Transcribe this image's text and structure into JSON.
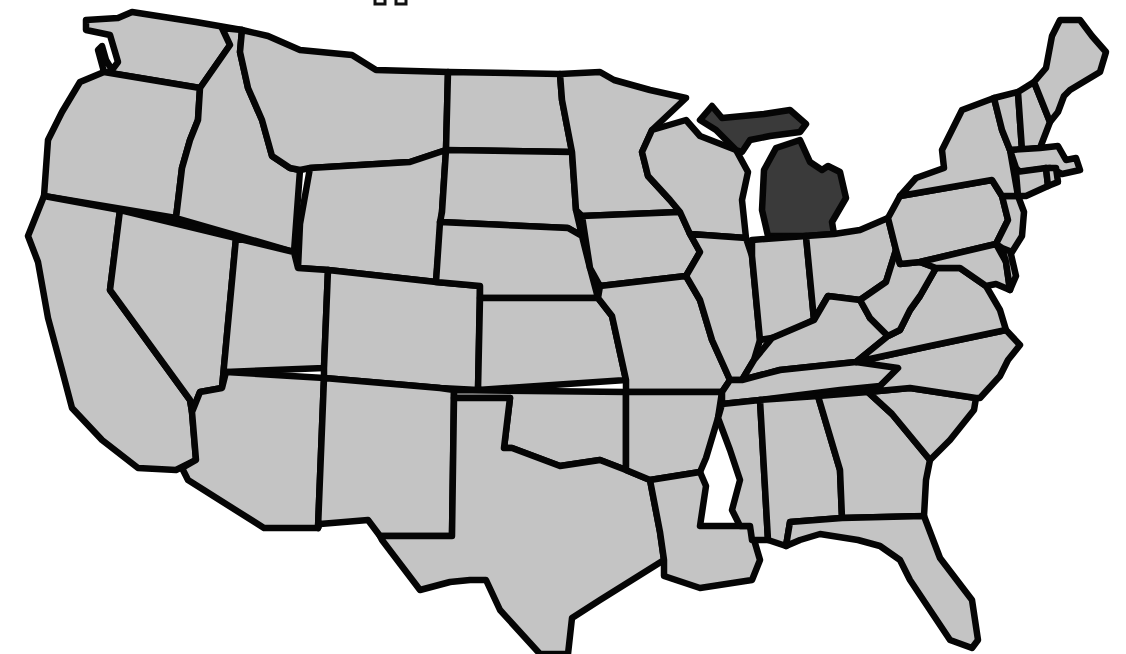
{
  "map": {
    "type": "choropleth-outline",
    "region": "Contiguous United States",
    "colors": {
      "background": "#ffffff",
      "state_fill": "#c4c4c4",
      "highlight_fill": "#3a3a3a",
      "border": "#050505"
    },
    "highlighted_states": [
      "Michigan"
    ],
    "states": [
      {
        "id": "WA",
        "name": "Washington",
        "highlighted": false
      },
      {
        "id": "OR",
        "name": "Oregon",
        "highlighted": false
      },
      {
        "id": "CA",
        "name": "California",
        "highlighted": false
      },
      {
        "id": "ID",
        "name": "Idaho",
        "highlighted": false
      },
      {
        "id": "NV",
        "name": "Nevada",
        "highlighted": false
      },
      {
        "id": "MT",
        "name": "Montana",
        "highlighted": false
      },
      {
        "id": "WY",
        "name": "Wyoming",
        "highlighted": false
      },
      {
        "id": "UT",
        "name": "Utah",
        "highlighted": false
      },
      {
        "id": "AZ",
        "name": "Arizona",
        "highlighted": false
      },
      {
        "id": "CO",
        "name": "Colorado",
        "highlighted": false
      },
      {
        "id": "NM",
        "name": "New Mexico",
        "highlighted": false
      },
      {
        "id": "ND",
        "name": "North Dakota",
        "highlighted": false
      },
      {
        "id": "SD",
        "name": "South Dakota",
        "highlighted": false
      },
      {
        "id": "NE",
        "name": "Nebraska",
        "highlighted": false
      },
      {
        "id": "KS",
        "name": "Kansas",
        "highlighted": false
      },
      {
        "id": "OK",
        "name": "Oklahoma",
        "highlighted": false
      },
      {
        "id": "TX",
        "name": "Texas",
        "highlighted": false
      },
      {
        "id": "MN",
        "name": "Minnesota",
        "highlighted": false
      },
      {
        "id": "IA",
        "name": "Iowa",
        "highlighted": false
      },
      {
        "id": "MO",
        "name": "Missouri",
        "highlighted": false
      },
      {
        "id": "AR",
        "name": "Arkansas",
        "highlighted": false
      },
      {
        "id": "LA",
        "name": "Louisiana",
        "highlighted": false
      },
      {
        "id": "WI",
        "name": "Wisconsin",
        "highlighted": false
      },
      {
        "id": "IL",
        "name": "Illinois",
        "highlighted": false
      },
      {
        "id": "MI",
        "name": "Michigan",
        "highlighted": true
      },
      {
        "id": "IN",
        "name": "Indiana",
        "highlighted": false
      },
      {
        "id": "OH",
        "name": "Ohio",
        "highlighted": false
      },
      {
        "id": "KY",
        "name": "Kentucky",
        "highlighted": false
      },
      {
        "id": "TN",
        "name": "Tennessee",
        "highlighted": false
      },
      {
        "id": "MS",
        "name": "Mississippi",
        "highlighted": false
      },
      {
        "id": "AL",
        "name": "Alabama",
        "highlighted": false
      },
      {
        "id": "GA",
        "name": "Georgia",
        "highlighted": false
      },
      {
        "id": "FL",
        "name": "Florida",
        "highlighted": false
      },
      {
        "id": "SC",
        "name": "South Carolina",
        "highlighted": false
      },
      {
        "id": "NC",
        "name": "North Carolina",
        "highlighted": false
      },
      {
        "id": "VA",
        "name": "Virginia",
        "highlighted": false
      },
      {
        "id": "WV",
        "name": "West Virginia",
        "highlighted": false
      },
      {
        "id": "PA",
        "name": "Pennsylvania",
        "highlighted": false
      },
      {
        "id": "NY",
        "name": "New York",
        "highlighted": false
      },
      {
        "id": "MD",
        "name": "Maryland",
        "highlighted": false
      },
      {
        "id": "DE",
        "name": "Delaware",
        "highlighted": false
      },
      {
        "id": "NJ",
        "name": "New Jersey",
        "highlighted": false
      },
      {
        "id": "CT",
        "name": "Connecticut",
        "highlighted": false
      },
      {
        "id": "RI",
        "name": "Rhode Island",
        "highlighted": false
      },
      {
        "id": "MA",
        "name": "Massachusetts",
        "highlighted": false
      },
      {
        "id": "VT",
        "name": "Vermont",
        "highlighted": false
      },
      {
        "id": "NH",
        "name": "New Hampshire",
        "highlighted": false
      },
      {
        "id": "ME",
        "name": "Maine",
        "highlighted": false
      }
    ]
  }
}
